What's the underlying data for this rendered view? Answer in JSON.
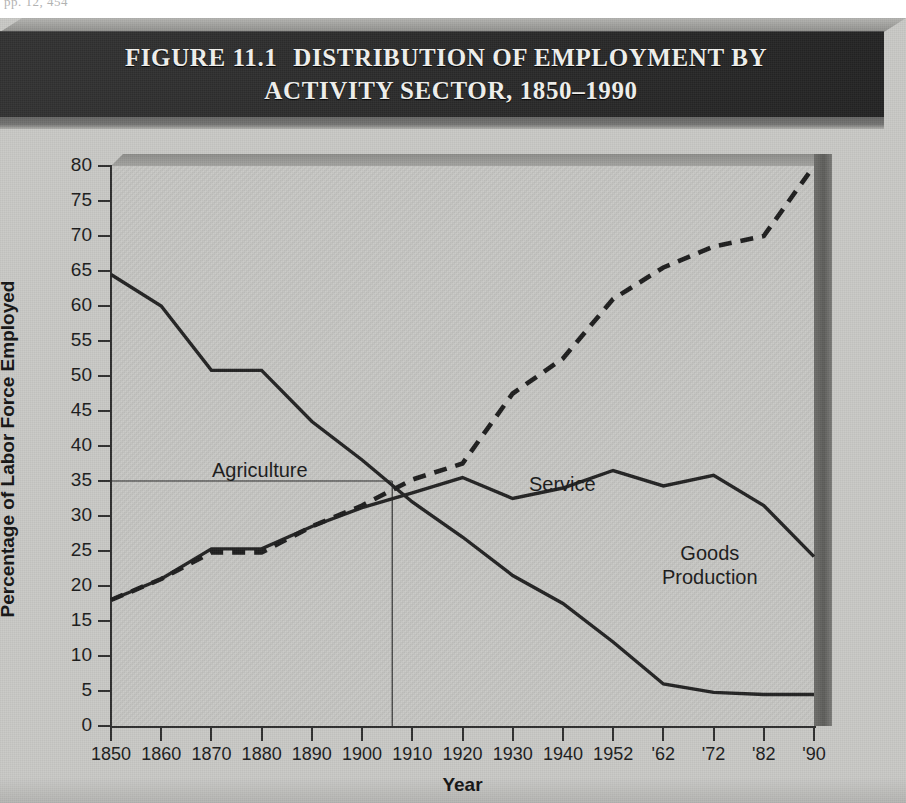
{
  "page": {
    "margin_note": "pp. 12, 454"
  },
  "figure": {
    "number": "FIGURE 11.1",
    "title_line1": "DISTRIBUTION OF EMPLOYMENT BY",
    "title_line2": "ACTIVITY SECTOR, 1850–1990"
  },
  "chart_data": {
    "type": "line",
    "xlabel": "Year",
    "ylabel": "Percentage of Labor Force Employed",
    "ylim": [
      0,
      80
    ],
    "ytick_step": 5,
    "yticks": [
      0,
      5,
      10,
      15,
      20,
      25,
      30,
      35,
      40,
      45,
      50,
      55,
      60,
      65,
      70,
      75,
      80
    ],
    "xtick_labels": [
      "1850",
      "1860",
      "1870",
      "1880",
      "1890",
      "1900",
      "1910",
      "1920",
      "1930",
      "1940",
      "1952",
      "'62",
      "'72",
      "'82",
      "'90"
    ],
    "x": [
      1850,
      1860,
      1870,
      1880,
      1890,
      1900,
      1910,
      1920,
      1930,
      1940,
      1952,
      1962,
      1972,
      1982,
      1990
    ],
    "grid": false,
    "legend_position": "inline-annotations",
    "annotations": [
      {
        "text": "Agriculture",
        "series": "Agriculture"
      },
      {
        "text": "Service",
        "series": "Service"
      },
      {
        "text": "Goods Production",
        "series": "Goods Production"
      }
    ],
    "crossover_guide": {
      "year": 1906,
      "value": 35,
      "note": "thin reference lines marking the crossing of Agriculture and Service near 35%"
    },
    "series": [
      {
        "name": "Agriculture",
        "style": "solid",
        "values": [
          64.5,
          60.0,
          50.8,
          50.8,
          43.5,
          38.0,
          32.0,
          27.0,
          21.5,
          17.5,
          12.0,
          6.0,
          4.8,
          4.5,
          4.5
        ]
      },
      {
        "name": "Goods Production",
        "style": "solid",
        "values": [
          18.0,
          21.0,
          25.3,
          25.3,
          28.5,
          31.2,
          33.3,
          35.5,
          32.5,
          34.0,
          36.5,
          34.3,
          35.8,
          31.5,
          24.2
        ]
      },
      {
        "name": "Service",
        "style": "dashed",
        "values": [
          18.0,
          21.0,
          24.8,
          24.8,
          28.5,
          31.5,
          35.2,
          37.5,
          47.5,
          52.5,
          61.0,
          65.5,
          68.5,
          70.0,
          80.0
        ]
      }
    ]
  }
}
